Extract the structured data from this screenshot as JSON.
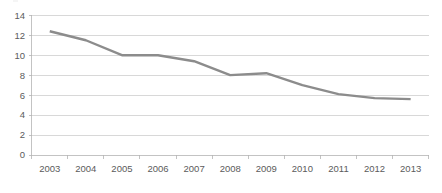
{
  "chart_data": {
    "type": "line",
    "title": "",
    "subtitle": "",
    "xlabel": "",
    "ylabel": "",
    "categories": [
      "2003",
      "2004",
      "2005",
      "2006",
      "2007",
      "2008",
      "2009",
      "2010",
      "2011",
      "2012",
      "2013"
    ],
    "series": [
      {
        "name": "series-1",
        "values": [
          12.4,
          11.5,
          10.0,
          10.0,
          9.4,
          8.0,
          8.2,
          7.0,
          6.1,
          5.7,
          5.6
        ],
        "color": "#8c8c8c"
      }
    ],
    "ylim": [
      0,
      14
    ],
    "y_ticks": [
      "0",
      "2",
      "4",
      "6",
      "8",
      "10",
      "12",
      "14"
    ],
    "y_tick_values": [
      0,
      2,
      4,
      6,
      8,
      10,
      12,
      14
    ],
    "x_ticks": [
      "2003",
      "2004",
      "2005",
      "2006",
      "2007",
      "2008",
      "2009",
      "2010",
      "2011",
      "2012",
      "2013"
    ],
    "grid": "horizontal",
    "legend": "none",
    "annotations": []
  },
  "colors": {
    "line": "#8c8c8c",
    "gridline": "#c8c8c8",
    "axis": "#b4b4b4",
    "text": "#5b5b5b",
    "background": "#ffffff"
  },
  "axes": {
    "y_axis_name": "value-axis",
    "x_axis_name": "year-axis"
  }
}
